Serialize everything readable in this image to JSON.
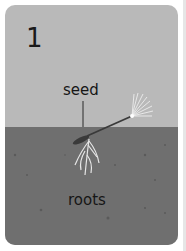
{
  "card": {
    "step_number": "1",
    "labels": {
      "seed": "seed",
      "roots": "roots"
    }
  },
  "colors": {
    "sky": "#b9b9b9",
    "soil": "#6f6f6f",
    "seed": "#3a3a3a",
    "roots": "#e8e8e8",
    "pappus": "#f4f4f4"
  }
}
